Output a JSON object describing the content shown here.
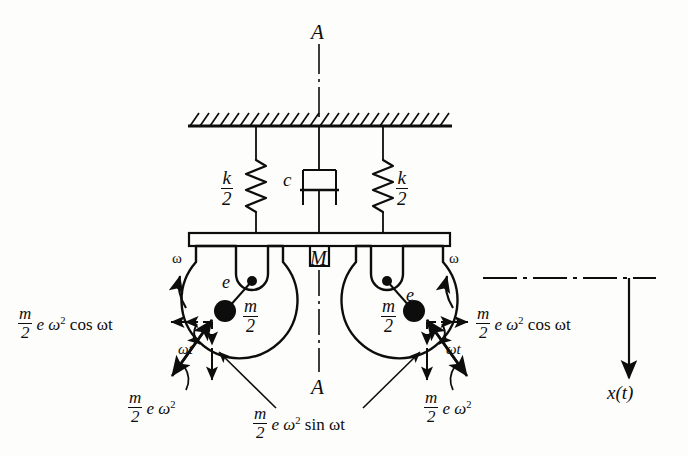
{
  "diagram": {
    "section_label_top": "A",
    "section_label_bottom": "A",
    "mass_label": "M",
    "damper_label": "c",
    "spring_left": {
      "num": "k",
      "den": "2"
    },
    "spring_right": {
      "num": "k",
      "den": "2"
    },
    "rotor_left": {
      "eccentricity_label": "e",
      "mass_num": "m",
      "mass_den": "2",
      "omega_label": "ω"
    },
    "rotor_right": {
      "eccentricity_label": "e",
      "mass_num": "m",
      "mass_den": "2",
      "omega_label": "ω"
    },
    "forces": {
      "cos_left": {
        "num": "m",
        "den": "2",
        "tail": "e ω",
        "exponent": "2",
        "trig": "cos ωt"
      },
      "cos_right": {
        "num": "m",
        "den": "2",
        "tail": "e ω",
        "exponent": "2",
        "trig": "cos ωt"
      },
      "resultant_left": {
        "num": "m",
        "den": "2",
        "tail": "e ω",
        "exponent": "2"
      },
      "resultant_right": {
        "num": "m",
        "den": "2",
        "tail": "e ω",
        "exponent": "2"
      },
      "sin_center": {
        "num": "m",
        "den": "2",
        "tail": "e ω",
        "exponent": "2",
        "trig": "sin ωt"
      },
      "angle_left": "ωt",
      "angle_right": "ωt"
    },
    "displacement_label": "x(t)",
    "colors": {
      "ink": "#0d0d0d",
      "background": "#fdfdfb"
    }
  }
}
